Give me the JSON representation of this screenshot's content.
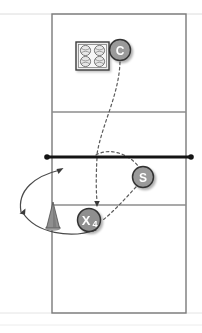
{
  "diagram": {
    "sport": "volleyball",
    "court": {
      "outline_color": "#7a7a7a",
      "line_color": "#8c8c8c",
      "faint_line_color": "#d8d8d8",
      "background": "#ffffff",
      "left": 52,
      "top": 14,
      "width": 134,
      "height": 299,
      "lines": [
        {
          "name": "top-baseline",
          "y": 14
        },
        {
          "name": "far-attack-line",
          "y": 112
        },
        {
          "name": "net-line",
          "y": 157
        },
        {
          "name": "near-attack-line",
          "y": 205
        },
        {
          "name": "bottom-baseline",
          "y": 313
        }
      ]
    },
    "net": {
      "name": "net",
      "y": 157,
      "x_start": 46,
      "x_end": 192,
      "color": "#1a1a1a",
      "thickness": 2.6,
      "post_radius": 2.6
    },
    "markers": [
      {
        "id": "coach",
        "label": "C",
        "x": 120,
        "y": 50,
        "r": 10.5,
        "fill": "#9a9a9a",
        "stroke": "#3a3a3a",
        "text": "C"
      },
      {
        "id": "setter",
        "label": "S",
        "x": 143,
        "y": 177,
        "r": 10.5,
        "fill": "#9a9a9a",
        "stroke": "#3a3a3a",
        "text": "S"
      },
      {
        "id": "hitter",
        "label": "X4",
        "x": 89,
        "y": 220,
        "r": 11.5,
        "fill": "#8f8f8f",
        "stroke": "#3a3a3a",
        "text": "X",
        "subscript": "4"
      }
    ],
    "ball_cart": {
      "name": "ball-cart",
      "x": 76,
      "y": 42,
      "width": 33,
      "height": 28,
      "fill": "#e8e8e8",
      "stroke": "#3d3d3d",
      "ball_count": 4,
      "ball_fill": "#e0e0e0",
      "ball_stroke": "#6a6a6a"
    },
    "cone": {
      "name": "cone",
      "x": 53,
      "y": 205,
      "width": 13,
      "height": 24,
      "fill": "#9e9e9e",
      "stroke": "#5a5a5a"
    },
    "paths": [
      {
        "name": "coach-toss-path",
        "style": "dashed",
        "color": "#5a5a5a",
        "d": "M 120 62 C 119 95, 102 125, 97 155",
        "arrow": false
      },
      {
        "name": "set-to-hitter-path",
        "style": "dashed",
        "color": "#5a5a5a",
        "d": "M 97 157 C 96 175, 96 190, 97 202",
        "arrow": true,
        "arrow_at": {
          "x": 97,
          "y": 205,
          "angle": 90
        }
      },
      {
        "name": "net-to-setter-path",
        "style": "dashed",
        "color": "#5a5a5a",
        "d": "M 96 156 C 112 148, 130 155, 139 168",
        "arrow": false
      },
      {
        "name": "setter-to-hitter-path",
        "style": "dashed",
        "color": "#5a5a5a",
        "d": "M 136 186 C 124 198, 112 212, 102 220",
        "arrow": false
      },
      {
        "name": "hitter-transition-path",
        "style": "solid",
        "color": "#4a4a4a",
        "d": "M 95 230 C 70 238, 36 232, 23 214",
        "arrow": true,
        "arrow_at": {
          "x": 22,
          "y": 212,
          "angle": 232
        }
      },
      {
        "name": "hitter-approach-path",
        "style": "solid",
        "color": "#4a4a4a",
        "d": "M 21 211 C 18 192, 34 176, 58 170",
        "arrow": true,
        "arrow_at": {
          "x": 61,
          "y": 169,
          "angle": 340
        }
      }
    ],
    "legend_hint": {
      "coach": "C",
      "setter": "S",
      "hitter": "X4"
    }
  }
}
